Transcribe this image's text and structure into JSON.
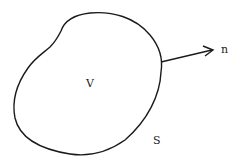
{
  "diagram": {
    "labels": {
      "volume": "V",
      "surface": "S",
      "normal": "n"
    },
    "colors": {
      "stroke": "#1a1a1a",
      "background": "#ffffff",
      "text": "#222222"
    }
  }
}
